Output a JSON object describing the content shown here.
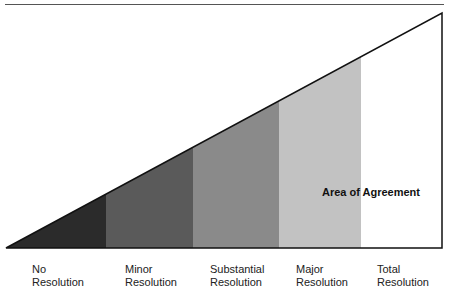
{
  "diagram": {
    "annotation": "Area of Agreement",
    "bands": [
      {
        "line1": "No",
        "line2": "Resolution",
        "color": "#2b2b2b",
        "x_start": 6,
        "x_end": 106
      },
      {
        "line1": "Minor",
        "line2": "Resolution",
        "color": "#5a5a5a",
        "x_start": 106,
        "x_end": 193
      },
      {
        "line1": "Substantial",
        "line2": "Resolution",
        "color": "#8a8a8a",
        "x_start": 193,
        "x_end": 279
      },
      {
        "line1": "Major",
        "line2": "Resolution",
        "color": "#c2c2c2",
        "x_start": 279,
        "x_end": 361
      },
      {
        "line1": "Total",
        "line2": "Resolution",
        "color": "#ffffff",
        "x_start": 361,
        "x_end": 442
      }
    ]
  }
}
